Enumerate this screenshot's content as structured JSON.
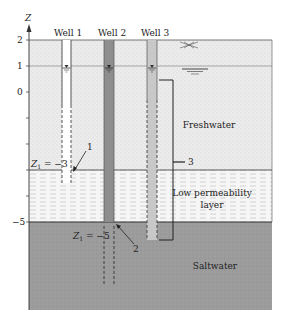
{
  "axis": {
    "label": "Z",
    "ticks": [
      {
        "value": 2,
        "label": "2",
        "y": 40
      },
      {
        "value": 1,
        "label": "1",
        "y": 66
      },
      {
        "value": 0,
        "label": "0",
        "y": 92
      },
      {
        "value": -1,
        "label": "",
        "y": 118
      },
      {
        "value": -2,
        "label": "",
        "y": 144
      },
      {
        "value": -3,
        "label": "",
        "y": 170
      },
      {
        "value": -4,
        "label": "",
        "y": 196
      },
      {
        "value": -5,
        "label": "−5",
        "y": 222
      }
    ]
  },
  "wells": [
    {
      "name": "Well 1",
      "label": "Well 1"
    },
    {
      "name": "Well 2",
      "label": "Well 2"
    },
    {
      "name": "Well 3",
      "label": "Well 3"
    }
  ],
  "layers": {
    "freshwater": "Freshwater",
    "low_perm_line1": "Low permeability",
    "low_perm_line2": "layer",
    "saltwater": "Saltwater"
  },
  "annotations": {
    "z1_well1": "Z",
    "z1_well1_sub": "1",
    "z1_well1_val": " = −3",
    "z1_well2": "Z",
    "z1_well2_sub": "1",
    "z1_well2_val": " = −5",
    "callout_1": "1",
    "callout_2": "2",
    "callout_3": "3"
  },
  "colors": {
    "freshwater": "#ececec",
    "low_perm": "#f4f4f4",
    "saltwater": "#9a9a9a",
    "well1": "#ffffff",
    "well2": "#8e8e8e",
    "well3": "#c8c8c8",
    "line": "#333333"
  }
}
